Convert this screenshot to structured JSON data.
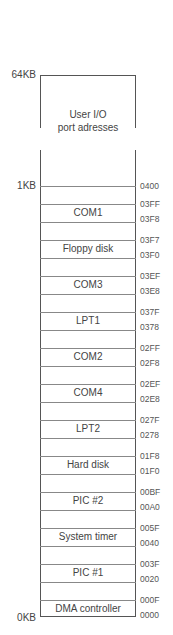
{
  "size_labels": {
    "top": "64KB",
    "mid": "1KB",
    "bottom": "0KB"
  },
  "user_region": {
    "line1": "User I/O",
    "line2": "port adresses",
    "top_address": "0400"
  },
  "regions": [
    {
      "label": "COM1",
      "high": "03FF",
      "low": "03F8"
    },
    {
      "label": "Floppy disk",
      "high": "03F7",
      "low": "03F0"
    },
    {
      "label": "COM3",
      "high": "03EF",
      "low": "03E8"
    },
    {
      "label": "LPT1",
      "high": "037F",
      "low": "0378"
    },
    {
      "label": "COM2",
      "high": "02FF",
      "low": "02F8"
    },
    {
      "label": "COM4",
      "high": "02EF",
      "low": "02E8"
    },
    {
      "label": "LPT2",
      "high": "027F",
      "low": "0278"
    },
    {
      "label": "Hard disk",
      "high": "01F8",
      "low": "01F0"
    },
    {
      "label": "PIC #2",
      "high": "00BF",
      "low": "00A0"
    },
    {
      "label": "System timer",
      "high": "005F",
      "low": "0040"
    },
    {
      "label": "PIC #1",
      "high": "003F",
      "low": "0020"
    },
    {
      "label": "DMA controller",
      "high": "000F",
      "low": "0000"
    }
  ]
}
